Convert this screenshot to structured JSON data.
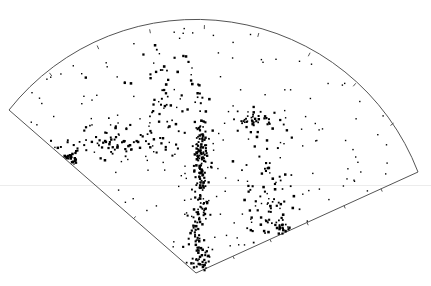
{
  "chart_data": {
    "type": "scatter",
    "subtype": "polar-wedge (redshift cone diagram)",
    "title": "",
    "xlabel": "",
    "ylabel": "",
    "legend": [],
    "grid": false,
    "geometry": {
      "apex": [
        196,
        273
      ],
      "left_corner": [
        9,
        110
      ],
      "right_corner": [
        418,
        172
      ],
      "arc_top": [
        210,
        17
      ],
      "tick_marks_on_arc": 8,
      "tick_marks_on_right_edge": 5,
      "tick_marks_on_left_edge": 2
    },
    "colors": {
      "points": "#000000",
      "frame": "#555555",
      "background": "#ffffff"
    },
    "clusters": [
      {
        "name": "central-finger",
        "cx": 200,
        "cy": 160,
        "sx": 4,
        "sy": 28,
        "n": 140
      },
      {
        "name": "lower-finger",
        "cx": 196,
        "cy": 225,
        "sx": 4,
        "sy": 18,
        "n": 45
      },
      {
        "name": "apex-clump",
        "cx": 200,
        "cy": 258,
        "sx": 5,
        "sy": 9,
        "n": 40
      },
      {
        "name": "left-wall",
        "cx": 110,
        "cy": 140,
        "sx": 28,
        "sy": 9,
        "n": 80
      },
      {
        "name": "left-edge-clump",
        "cx": 64,
        "cy": 158,
        "sx": 7,
        "sy": 4,
        "n": 30
      },
      {
        "name": "upper-mid",
        "cx": 165,
        "cy": 95,
        "sx": 20,
        "sy": 22,
        "n": 55
      },
      {
        "name": "right-arm",
        "cx": 250,
        "cy": 120,
        "sx": 14,
        "sy": 8,
        "n": 45
      },
      {
        "name": "right-lower",
        "cx": 270,
        "cy": 195,
        "sx": 18,
        "sy": 28,
        "n": 70
      },
      {
        "name": "right-bottom-clump",
        "cx": 282,
        "cy": 228,
        "sx": 3,
        "sy": 5,
        "n": 18
      },
      {
        "name": "field",
        "cx": 0,
        "cy": 0,
        "sx": 0,
        "sy": 0,
        "n": 180
      }
    ]
  }
}
